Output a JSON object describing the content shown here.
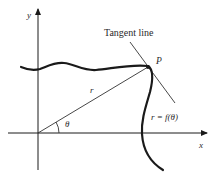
{
  "diagram": {
    "labels": {
      "y_axis": "y",
      "x_axis": "x",
      "tangent": "Tangent line",
      "point": "P",
      "radius": "r",
      "angle": "θ",
      "curve": "r = f(θ)"
    },
    "colors": {
      "stroke": "#1a1a1a",
      "text": "#2a2a2a",
      "background": "#ffffff"
    }
  }
}
